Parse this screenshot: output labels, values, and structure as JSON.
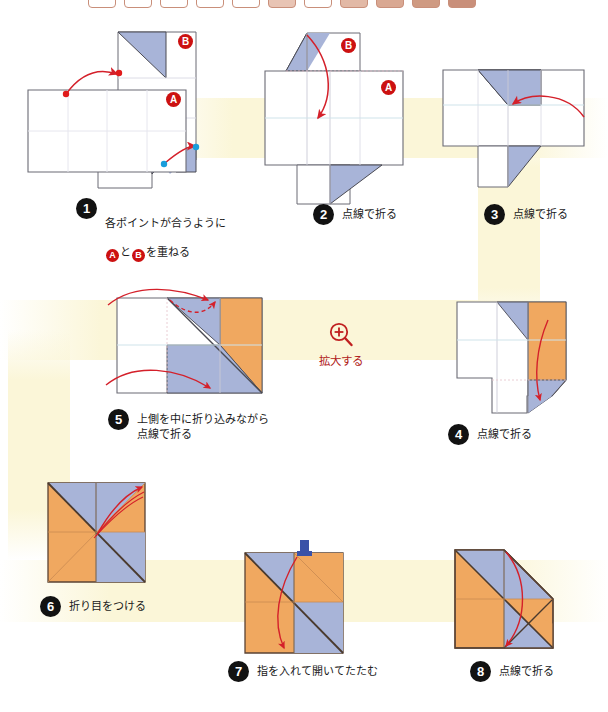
{
  "page": {
    "width": 608,
    "height": 712
  },
  "palette": {
    "paper_front": "#f0a860",
    "paper_back": "#a8b4d8",
    "paper_white": "#ffffff",
    "outline": "#4a4a52",
    "crease": "#d8d8e0",
    "arrow_red": "#d4202a",
    "badge_black": "#121212",
    "marker_red": "#cc1111",
    "point_red": "#e01b1b",
    "point_blue": "#1a9ddb",
    "band_yellow": "#fbf6d8",
    "zoom_red": "#b02020",
    "chip_border": "#c98f7a"
  },
  "zoom_link": {
    "label": "拡大する",
    "icon": "magnifier-plus-icon"
  },
  "steps": [
    {
      "number": "1",
      "caption": "各ポイントが合うように\nAとBを重ねる",
      "caption_line1": "各ポイントが合うように",
      "caption_line2_pre": "",
      "caption_line2_mid": "と",
      "caption_line2_post": "を重ねる",
      "markers": [
        "A",
        "B"
      ]
    },
    {
      "number": "2",
      "caption": "点線で折る",
      "markers": [
        "A",
        "B"
      ]
    },
    {
      "number": "3",
      "caption": "点線で折る",
      "markers": []
    },
    {
      "number": "4",
      "caption": "点線で折る",
      "markers": []
    },
    {
      "number": "5",
      "caption": "上側を中に折り込みながら\n点線で折る",
      "markers": []
    },
    {
      "number": "6",
      "caption": "折り目をつける",
      "markers": []
    },
    {
      "number": "7",
      "caption": "指を入れて開いてたたむ",
      "markers": []
    },
    {
      "number": "8",
      "caption": "点線で折る",
      "markers": []
    }
  ],
  "markers": {
    "a": "A",
    "b": "B"
  },
  "top_strip": {
    "chip_count": 11
  }
}
